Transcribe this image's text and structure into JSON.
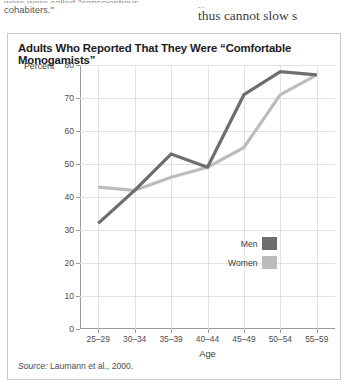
{
  "page_text": {
    "left_clipped": "were  were called  \"conscientious",
    "left_visible": "cohabiters.\"",
    "right_clipped": "y",
    "right_visible": "thus cannot slow s"
  },
  "figure": {
    "title": "Adults Who Reported That They Were “Comfortable Monogamists”",
    "source": "Source:",
    "source_detail": " Laumann et al., 2000."
  },
  "chart_data": {
    "type": "line",
    "title": "Adults Who Reported That They Were “Comfortable Monogamists”",
    "categories": [
      "25–29",
      "30–34",
      "35–39",
      "40–44",
      "45–49",
      "50–54",
      "55–59"
    ],
    "series": [
      {
        "name": "Men",
        "values": [
          32,
          42,
          53,
          49,
          71,
          78,
          77
        ],
        "color": "#6d6d6d"
      },
      {
        "name": "Women",
        "values": [
          43,
          42,
          46,
          49,
          55,
          71,
          77
        ],
        "color": "#bcbcbc"
      }
    ],
    "xlabel": "Age",
    "ylabel": "Percent",
    "ylim": [
      0,
      80
    ],
    "yticks": [
      0,
      10,
      20,
      30,
      40,
      50,
      60,
      70,
      80
    ],
    "ytick_labels": [
      "0",
      "10",
      "20",
      "30",
      "40",
      "50",
      "60",
      "70",
      "80"
    ],
    "grid": true,
    "legend_position": "inside-right"
  }
}
